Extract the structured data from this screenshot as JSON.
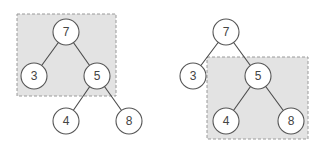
{
  "diagram": {
    "title": "",
    "trees": [
      {
        "id": "left",
        "highlight_region": {
          "x": 17,
          "y": 14,
          "width": 99,
          "height": 82,
          "description": "subtree rooted at 7 containing nodes 7, 3, 5"
        },
        "nodes": [
          {
            "id": "L7",
            "label": "7",
            "x": 66,
            "y": 32
          },
          {
            "id": "L3",
            "label": "3",
            "x": 34,
            "y": 76
          },
          {
            "id": "L5",
            "label": "5",
            "x": 97,
            "y": 76
          },
          {
            "id": "L4",
            "label": "4",
            "x": 66,
            "y": 121
          },
          {
            "id": "L8",
            "label": "8",
            "x": 129,
            "y": 121
          }
        ],
        "edges": [
          [
            "L7",
            "L3"
          ],
          [
            "L7",
            "L5"
          ],
          [
            "L5",
            "L4"
          ],
          [
            "L5",
            "L8"
          ]
        ]
      },
      {
        "id": "right",
        "highlight_region": {
          "x": 207,
          "y": 57,
          "width": 101,
          "height": 82,
          "description": "subtree rooted at 5 containing nodes 5, 4, 8"
        },
        "nodes": [
          {
            "id": "R7",
            "label": "7",
            "x": 226,
            "y": 32
          },
          {
            "id": "R3",
            "label": "3",
            "x": 193,
            "y": 76
          },
          {
            "id": "R5",
            "label": "5",
            "x": 258,
            "y": 76
          },
          {
            "id": "R4",
            "label": "4",
            "x": 226,
            "y": 121
          },
          {
            "id": "R8",
            "label": "8",
            "x": 291,
            "y": 121
          }
        ],
        "edges": [
          [
            "R7",
            "R3"
          ],
          [
            "R7",
            "R5"
          ],
          [
            "R5",
            "R4"
          ],
          [
            "R5",
            "R8"
          ]
        ]
      }
    ],
    "node_radius": 13,
    "colors": {
      "region_fill": "#e3e3e3",
      "region_border": "#9a9a9a",
      "edge": "#4a4a4a",
      "node_stroke": "#555555",
      "node_fill": "#ffffff",
      "label": "#444444"
    }
  }
}
